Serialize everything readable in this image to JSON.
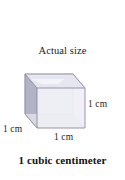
{
  "figure": {
    "title": "Actual size",
    "caption": "1 cubic centimeter",
    "background_color": "#ffffff",
    "text_color": "#1c1c1c"
  },
  "cube": {
    "shape_name": "cube",
    "projection": "oblique",
    "front_face_color": "#ebebf2",
    "left_face_color": "#b3b3c6",
    "top_face_color": "#e4e4ee",
    "base_face_color": "#d6d6e2",
    "edge_color": "#8e8ea6",
    "inner_edge_color": "#b8b8c9"
  },
  "labels": {
    "height": "1 cm",
    "depth": "1 cm",
    "width": "1 cm"
  }
}
